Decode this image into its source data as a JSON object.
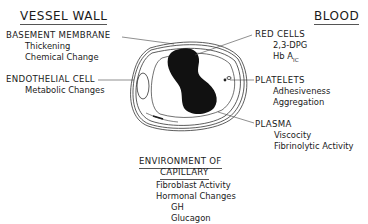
{
  "headings": {
    "vessel_wall": "VESSEL WALL",
    "blood": "BLOOD"
  },
  "labels": {
    "basement_membrane": {
      "title": "BASEMENT MEMBRANE",
      "items": [
        "Thickening",
        "Chemical Change"
      ]
    },
    "endothelial_cell": {
      "title": "ENDOTHELIAL CELL",
      "items": [
        "Metabolic Changes"
      ]
    },
    "red_cells": {
      "title": "RED CELLS",
      "items": [
        "2,3-DPG",
        "Hb A"
      ],
      "hb_subscript": "IC"
    },
    "platelets": {
      "title": "PLATELETS",
      "items": [
        "Adhesiveness",
        "Aggregation"
      ]
    },
    "plasma": {
      "title": "PLASMA",
      "items": [
        "Viscocity",
        "Fibrinolytic Activity"
      ]
    },
    "environment": {
      "title_line1": "ENVIRONMENT OF",
      "title_line2": "CAPILLARY",
      "items": [
        "Fibroblast Activity",
        "Hormonal Changes",
        "GH",
        "Glucagon"
      ]
    }
  },
  "colors": {
    "ink": "#1a1a1a",
    "background": "#ffffff"
  }
}
